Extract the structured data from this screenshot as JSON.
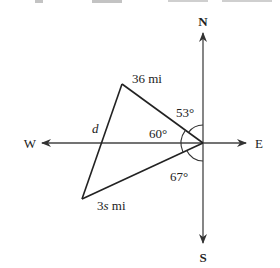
{
  "diagram": {
    "type": "compass-bearing-triangle",
    "directions": {
      "north": "N",
      "south": "S",
      "east": "E",
      "west": "W"
    },
    "sides": {
      "upper": "36 mi",
      "lower_prefix": "3",
      "lower_var": "s",
      "lower_suffix": " mi",
      "unknown": "d"
    },
    "angles": {
      "north_bearing": "53°",
      "included": "60°",
      "south_bearing": "67°"
    },
    "colors": {
      "ink": "#222222",
      "background": "#ffffff"
    }
  }
}
